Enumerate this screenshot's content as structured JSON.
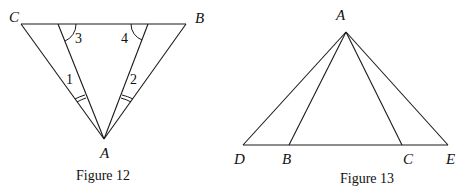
{
  "figures": [
    {
      "caption": "Figure 12",
      "points": {
        "C": "C",
        "B": "B",
        "A": "A"
      },
      "angle_labels": [
        "1",
        "2",
        "3",
        "4"
      ]
    },
    {
      "caption": "Figure 13",
      "points": {
        "A": "A",
        "D": "D",
        "B": "B",
        "C": "C",
        "E": "E"
      }
    }
  ]
}
